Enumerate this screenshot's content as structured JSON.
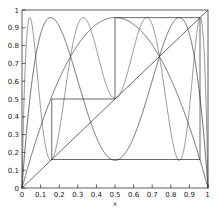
{
  "chart_data": {
    "type": "line",
    "title": "",
    "subtitle": "",
    "xlabel": "x",
    "ylabel": "",
    "xlim": [
      0,
      1
    ],
    "ylim": [
      0,
      1
    ],
    "grid": false,
    "legend": "none",
    "frame": true,
    "xticks": [
      "0",
      "0.1",
      "0.2",
      "0.3",
      "0.4",
      "0.5",
      "0.6",
      "0.7",
      "0.8",
      "0.9",
      "1"
    ],
    "xtick_values": [
      0,
      0.1,
      0.2,
      0.3,
      0.4,
      0.5,
      0.6,
      0.7,
      0.8,
      0.9,
      1
    ],
    "yticks": [
      "0",
      "0.1",
      "0.2",
      "0.3",
      "0.4",
      "0.5",
      "0.6",
      "0.7",
      "0.8",
      "0.9",
      "1"
    ],
    "ytick_values": [
      0,
      0.1,
      0.2,
      0.3,
      0.4,
      0.5,
      0.6,
      0.7,
      0.8,
      0.9,
      1
    ],
    "series": [
      {
        "name": "f(x) = 3.83 x (1-x)",
        "kind": "logistic-iterate",
        "r": 3.83,
        "iterate": 1,
        "style": "solid",
        "color": "#303030",
        "humps": 1,
        "peak": [
          0.5,
          0.9575
        ]
      },
      {
        "name": "f2(x)",
        "kind": "logistic-iterate",
        "r": 3.83,
        "iterate": 2,
        "style": "solid",
        "color": "#303030",
        "humps": 2,
        "peaks": [
          [
            0.31,
            0.957
          ],
          [
            0.66,
            0.957
          ]
        ]
      },
      {
        "name": "f3(x)",
        "kind": "logistic-iterate",
        "r": 3.83,
        "iterate": 3,
        "style": "dotted",
        "color": "#4a4a4a",
        "humps": 4,
        "peaks": [
          [
            0.035,
            0.957
          ],
          [
            0.345,
            0.957
          ],
          [
            0.62,
            0.957
          ],
          [
            0.905,
            0.957
          ]
        ]
      },
      {
        "name": "y = x",
        "kind": "diagonal",
        "style": "solid",
        "color": "#303030",
        "points": [
          [
            0,
            0
          ],
          [
            1,
            1
          ]
        ]
      }
    ],
    "cobweb": {
      "name": "period-3 orbit cobweb",
      "style": "solid",
      "color": "#303030",
      "vertices": [
        [
          0.16,
          0.16
        ],
        [
          0.16,
          0.5
        ],
        [
          0.5,
          0.5
        ],
        [
          0.5,
          0.957
        ],
        [
          0.957,
          0.957
        ],
        [
          0.957,
          0.16
        ],
        [
          0.16,
          0.16
        ]
      ],
      "fixed_points": [
        0.16,
        0.5,
        0.957
      ]
    }
  },
  "axes": {
    "x_axis_label": "x",
    "y_axis_label": ""
  }
}
